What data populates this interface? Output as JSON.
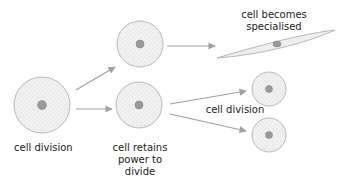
{
  "labels": {
    "start": "cell division",
    "specialised_line1": "cell becomes",
    "specialised_line2": "specialised",
    "retains_line1": "cell retains",
    "retains_line2": "power to",
    "retains_line3": "divide",
    "second_division": "cell division"
  },
  "colors": {
    "cell_fill": "#ececec",
    "cell_stroke": "#a8a8a8",
    "nucleus_fill": "#9a9a9a",
    "arrow": "#a0a0a0",
    "text": "#222222"
  }
}
